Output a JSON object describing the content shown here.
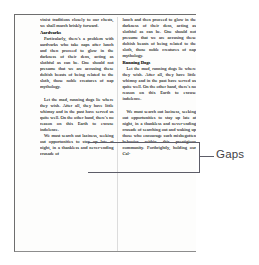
{
  "document": {
    "type": "scanned-newspaper-page",
    "columns": [
      {
        "id": "left",
        "blocks": [
          {
            "kind": "paragraph",
            "indent": false,
            "gap_before": false,
            "text": "vinist traditions closely to our chests, we shall march briskly forward."
          },
          {
            "kind": "heading",
            "text": "Aardvarks"
          },
          {
            "kind": "paragraph",
            "indent": true,
            "gap_before": false,
            "text": "Particularly, there's a problem with aardvarks who take naps after lunch and then proceed to glow in the darkness of their dens, acting as slothful as can be. One should not presume that we are accusing these doltish beasts of being related to the sloth, those noble creatures of nap mythology."
          },
          {
            "kind": "paragraph",
            "indent": true,
            "gap_before": true,
            "text": "Let the mad, running dogs lie where they wish. After all, they have little whimsy and in the past have served us quite well. On the other hand, there's no reason on this Earth to excuse indolence."
          },
          {
            "kind": "paragraph",
            "indent": true,
            "gap_before": false,
            "text": "We must search out laziness, seeking out opportunities to stay up late at night, in a thankless and never-ending crusade of"
          }
        ]
      },
      {
        "id": "right",
        "blocks": [
          {
            "kind": "paragraph",
            "indent": false,
            "gap_before": false,
            "text": "lunch and then proceed to glow in the darkness of their dens, acting as slothful as can be. One should not presume that we are accusing these doltish beasts of being related to the sloth, those noble creatures of nap mythology."
          },
          {
            "kind": "heading",
            "text": "Running Dogs"
          },
          {
            "kind": "paragraph",
            "indent": true,
            "gap_before": false,
            "text": "Let the mad, running dogs lie where they wish. After all, they have little whimsy and in the past have served us quite well. On the other hand, there's no reason on this Earth to excuse indolence."
          },
          {
            "kind": "paragraph",
            "indent": true,
            "gap_before": true,
            "text": "We must search out laziness, seeking out opportunities to stay up late at night, in a thankless and never-ending crusade of searching out and waking up those who encourage such misbegotten behavior within this prestigious community. Forthrightly, holding our Cal-"
          }
        ]
      }
    ]
  },
  "annotation": {
    "label": "Gaps",
    "bracket_color": "#5d5d68",
    "label_color": "#3f3f46"
  },
  "colors": {
    "page_background": "#fdfdfc",
    "canvas_background": "#ffffff",
    "text": "#1b1b1b",
    "page_border": "#6e6e6e",
    "column_rule": "#dcdcdc"
  }
}
